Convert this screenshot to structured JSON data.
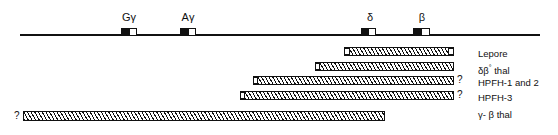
{
  "figure": {
    "type": "gene-deletion-map",
    "locus": {
      "line_start_px": 20,
      "line_end_px": 540,
      "axis_y_px": 34
    },
    "genes": [
      {
        "name": "G-gamma",
        "label": "Gγ",
        "label_x_px": 121,
        "box_x_px": 121,
        "box_w_px": 16
      },
      {
        "name": "A-gamma",
        "label": "Aγ",
        "label_x_px": 180,
        "box_x_px": 180,
        "box_w_px": 16
      },
      {
        "name": "delta",
        "label": "δ",
        "label_x_px": 363,
        "box_x_px": 361,
        "box_w_px": 15
      },
      {
        "name": "beta",
        "label": "β",
        "label_x_px": 417,
        "box_x_px": 413,
        "box_w_px": 17
      }
    ],
    "deletions": [
      {
        "name": "lepore",
        "label": "Lepore",
        "bar_x_px": 344,
        "bar_w_px": 110,
        "bar_y_px": 47,
        "bar_h_px": 9,
        "cap_left": true,
        "cap_right": true,
        "qmark_left": "",
        "qmark_right": "",
        "label_x_px": 478,
        "label_y_px": 48
      },
      {
        "name": "delta-beta-zero-thal",
        "label": "δβ° thal",
        "bar_x_px": 315,
        "bar_w_px": 139,
        "bar_y_px": 62,
        "bar_h_px": 9,
        "cap_left": true,
        "cap_right": false,
        "qmark_left": "",
        "qmark_right": "",
        "label_x_px": 478,
        "label_y_px": 62
      },
      {
        "name": "hpfh-1-and-2",
        "label": "HPFH-1 and 2",
        "bar_x_px": 253,
        "bar_w_px": 201,
        "bar_y_px": 76,
        "bar_h_px": 9,
        "cap_left": true,
        "cap_right": false,
        "qmark_left": "",
        "qmark_right": "?",
        "label_x_px": 478,
        "label_y_px": 77
      },
      {
        "name": "hpfh-3",
        "label": "HPFH-3",
        "bar_x_px": 240,
        "bar_w_px": 214,
        "bar_y_px": 91,
        "bar_h_px": 9,
        "cap_left": true,
        "cap_right": false,
        "qmark_left": "",
        "qmark_right": "?",
        "label_x_px": 478,
        "label_y_px": 92
      },
      {
        "name": "gamma-beta-thal",
        "label": "γ- β thal",
        "bar_x_px": 23,
        "bar_w_px": 362,
        "bar_y_px": 111,
        "bar_h_px": 10,
        "cap_left": false,
        "cap_right": false,
        "qmark_left": "?",
        "qmark_right": "",
        "label_x_px": 478,
        "label_y_px": 109
      }
    ],
    "colors": {
      "ink": "#111111",
      "background": "#ffffff"
    }
  }
}
